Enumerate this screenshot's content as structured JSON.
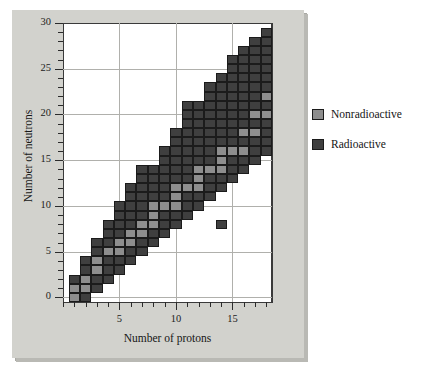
{
  "figure": {
    "xaxis_title": "Number of protons",
    "yaxis_title": "Number of neutrons"
  },
  "legend": {
    "items": [
      {
        "label": "Nonradioactive",
        "color": "#8e8e8e",
        "key": "nonradioactive"
      },
      {
        "label": "Radioactive",
        "color": "#3f3f3f",
        "key": "radioactive"
      }
    ]
  },
  "chart_data": {
    "type": "heatmap",
    "title": "",
    "xlabel": "Number of protons",
    "ylabel": "Number of neutrons",
    "xlim": [
      0,
      18.5
    ],
    "ylim": [
      -0.5,
      30
    ],
    "xticks_major": [
      5,
      10,
      15
    ],
    "xticks_major_labels": [
      "5",
      "10",
      "15"
    ],
    "xtick_minor_step": 1,
    "yticks_major": [
      0,
      5,
      10,
      15,
      20,
      25,
      30
    ],
    "yticks_major_labels": [
      "0",
      "5",
      "10",
      "15",
      "20",
      "25",
      "30"
    ],
    "ytick_minor_step": 1,
    "grid": true,
    "legend_position": "right",
    "cell_categories": [
      "nonradioactive",
      "radioactive"
    ],
    "colors": {
      "nonradioactive": "#8e8e8e",
      "radioactive": "#3f3f3f"
    },
    "note": "Each cell is one nuclide at (protons Z, neutrons N). Stable (nonradioactive) nuclides form the band of stability.",
    "nonradioactive_cells": [
      [
        1,
        0
      ],
      [
        1,
        1
      ],
      [
        2,
        1
      ],
      [
        2,
        2
      ],
      [
        3,
        3
      ],
      [
        3,
        4
      ],
      [
        4,
        5
      ],
      [
        5,
        5
      ],
      [
        5,
        6
      ],
      [
        6,
        6
      ],
      [
        6,
        7
      ],
      [
        7,
        7
      ],
      [
        7,
        8
      ],
      [
        8,
        8
      ],
      [
        8,
        9
      ],
      [
        8,
        10
      ],
      [
        9,
        10
      ],
      [
        10,
        10
      ],
      [
        10,
        11
      ],
      [
        10,
        12
      ],
      [
        11,
        12
      ],
      [
        12,
        12
      ],
      [
        12,
        13
      ],
      [
        12,
        14
      ],
      [
        13,
        14
      ],
      [
        14,
        14
      ],
      [
        14,
        15
      ],
      [
        14,
        16
      ],
      [
        15,
        16
      ],
      [
        16,
        16
      ],
      [
        16,
        18
      ],
      [
        17,
        18
      ],
      [
        17,
        20
      ],
      [
        18,
        20
      ],
      [
        18,
        22
      ]
    ],
    "radioactive_cells": [
      [
        1,
        2
      ],
      [
        2,
        0
      ],
      [
        2,
        3
      ],
      [
        2,
        4
      ],
      [
        3,
        1
      ],
      [
        3,
        2
      ],
      [
        3,
        5
      ],
      [
        3,
        6
      ],
      [
        4,
        2
      ],
      [
        4,
        3
      ],
      [
        4,
        4
      ],
      [
        4,
        6
      ],
      [
        4,
        7
      ],
      [
        4,
        8
      ],
      [
        5,
        3
      ],
      [
        5,
        4
      ],
      [
        5,
        7
      ],
      [
        5,
        8
      ],
      [
        5,
        9
      ],
      [
        5,
        10
      ],
      [
        6,
        4
      ],
      [
        6,
        5
      ],
      [
        6,
        8
      ],
      [
        6,
        9
      ],
      [
        6,
        10
      ],
      [
        6,
        11
      ],
      [
        6,
        12
      ],
      [
        7,
        5
      ],
      [
        7,
        6
      ],
      [
        7,
        9
      ],
      [
        7,
        10
      ],
      [
        7,
        11
      ],
      [
        7,
        12
      ],
      [
        7,
        13
      ],
      [
        7,
        14
      ],
      [
        8,
        6
      ],
      [
        8,
        7
      ],
      [
        8,
        11
      ],
      [
        8,
        12
      ],
      [
        8,
        13
      ],
      [
        8,
        14
      ],
      [
        9,
        7
      ],
      [
        9,
        8
      ],
      [
        9,
        9
      ],
      [
        9,
        11
      ],
      [
        9,
        12
      ],
      [
        9,
        13
      ],
      [
        9,
        14
      ],
      [
        9,
        15
      ],
      [
        9,
        16
      ],
      [
        10,
        8
      ],
      [
        10,
        9
      ],
      [
        10,
        13
      ],
      [
        10,
        14
      ],
      [
        10,
        15
      ],
      [
        10,
        16
      ],
      [
        10,
        17
      ],
      [
        10,
        18
      ],
      [
        11,
        9
      ],
      [
        11,
        10
      ],
      [
        11,
        11
      ],
      [
        11,
        13
      ],
      [
        11,
        14
      ],
      [
        11,
        15
      ],
      [
        11,
        16
      ],
      [
        11,
        17
      ],
      [
        11,
        18
      ],
      [
        11,
        19
      ],
      [
        11,
        20
      ],
      [
        11,
        21
      ],
      [
        12,
        10
      ],
      [
        12,
        11
      ],
      [
        12,
        15
      ],
      [
        12,
        16
      ],
      [
        12,
        17
      ],
      [
        12,
        18
      ],
      [
        12,
        19
      ],
      [
        12,
        20
      ],
      [
        12,
        21
      ],
      [
        13,
        11
      ],
      [
        13,
        12
      ],
      [
        13,
        13
      ],
      [
        13,
        15
      ],
      [
        13,
        16
      ],
      [
        13,
        17
      ],
      [
        13,
        18
      ],
      [
        13,
        19
      ],
      [
        13,
        20
      ],
      [
        13,
        21
      ],
      [
        13,
        22
      ],
      [
        13,
        23
      ],
      [
        14,
        12
      ],
      [
        14,
        13
      ],
      [
        14,
        17
      ],
      [
        14,
        18
      ],
      [
        14,
        19
      ],
      [
        14,
        20
      ],
      [
        14,
        21
      ],
      [
        14,
        22
      ],
      [
        14,
        23
      ],
      [
        14,
        24
      ],
      [
        14,
        8
      ],
      [
        15,
        13
      ],
      [
        15,
        14
      ],
      [
        15,
        15
      ],
      [
        15,
        17
      ],
      [
        15,
        18
      ],
      [
        15,
        19
      ],
      [
        15,
        20
      ],
      [
        15,
        21
      ],
      [
        15,
        22
      ],
      [
        15,
        23
      ],
      [
        15,
        24
      ],
      [
        15,
        25
      ],
      [
        15,
        26
      ],
      [
        16,
        14
      ],
      [
        16,
        15
      ],
      [
        16,
        17
      ],
      [
        16,
        19
      ],
      [
        16,
        20
      ],
      [
        16,
        21
      ],
      [
        16,
        22
      ],
      [
        16,
        23
      ],
      [
        16,
        24
      ],
      [
        16,
        25
      ],
      [
        16,
        26
      ],
      [
        16,
        27
      ],
      [
        17,
        15
      ],
      [
        17,
        16
      ],
      [
        17,
        17
      ],
      [
        17,
        19
      ],
      [
        17,
        21
      ],
      [
        17,
        22
      ],
      [
        17,
        23
      ],
      [
        17,
        24
      ],
      [
        17,
        25
      ],
      [
        17,
        26
      ],
      [
        17,
        27
      ],
      [
        17,
        28
      ],
      [
        18,
        16
      ],
      [
        18,
        17
      ],
      [
        18,
        18
      ],
      [
        18,
        19
      ],
      [
        18,
        21
      ],
      [
        18,
        23
      ],
      [
        18,
        24
      ],
      [
        18,
        25
      ],
      [
        18,
        26
      ],
      [
        18,
        27
      ],
      [
        18,
        28
      ],
      [
        18,
        29
      ]
    ]
  }
}
